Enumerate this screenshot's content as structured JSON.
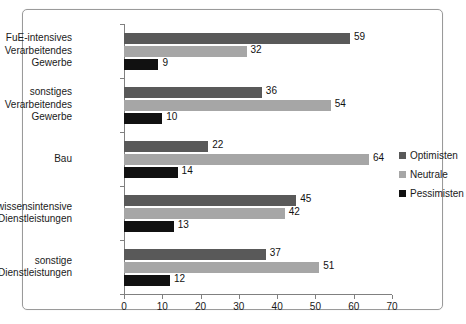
{
  "chart_data": {
    "type": "bar",
    "orientation": "horizontal",
    "title": "",
    "subtitle": "",
    "xlabel": "",
    "ylabel": "",
    "xlim": [
      0,
      70
    ],
    "xticks": [
      0,
      10,
      20,
      30,
      40,
      50,
      60,
      70
    ],
    "grid": false,
    "legend_position": "right",
    "categories": [
      "FuE-intensives Verarbeitendes Gewerbe",
      "sonstiges Verarbeitendes Gewerbe",
      "Bau",
      "wissensintensive Dienstleistungen",
      "sonstige Dienstleistungen"
    ],
    "category_label_lines": [
      [
        "FuE-intensives",
        "Verarbeitendes",
        "Gewerbe"
      ],
      [
        "sonstiges",
        "Verarbeitendes",
        "Gewerbe"
      ],
      [
        "Bau"
      ],
      [
        "wissensintensive",
        "Dienstleistungen"
      ],
      [
        "sonstige",
        "Dienstleistungen"
      ]
    ],
    "series": [
      {
        "name": "Optimisten",
        "color": "#595959",
        "values": [
          59,
          36,
          22,
          45,
          37
        ]
      },
      {
        "name": "Neutrale",
        "color": "#a6a6a6",
        "values": [
          32,
          54,
          64,
          42,
          51
        ]
      },
      {
        "name": "Pessimisten",
        "color": "#111111",
        "values": [
          9,
          10,
          14,
          13,
          12
        ]
      }
    ]
  },
  "legend": {
    "items": [
      {
        "label": "Optimisten",
        "color": "#595959"
      },
      {
        "label": "Neutrale",
        "color": "#a6a6a6"
      },
      {
        "label": "Pessimisten",
        "color": "#111111"
      }
    ]
  },
  "axis": {
    "x_tick_labels": [
      "0",
      "10",
      "20",
      "30",
      "40",
      "50",
      "60",
      "70"
    ]
  },
  "colors": {
    "frame_border": "#9a9a9a",
    "axis": "#808080",
    "text": "#1a1a1a",
    "background": "#ffffff"
  }
}
